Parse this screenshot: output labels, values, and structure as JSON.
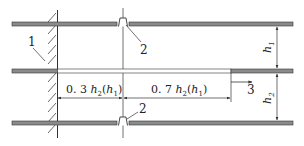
{
  "diagram": {
    "type": "technical-schematic",
    "colors": {
      "plate_fill": "#8a8a8a",
      "plate_stroke": "#333333",
      "line": "#333333",
      "background": "#ffffff"
    },
    "labels": {
      "wall": "1",
      "nozzle_top": "2",
      "nozzle_bottom": "2",
      "flow_direction": "3",
      "dim_left_prefix": "0. 3",
      "dim_left_var": "h",
      "dim_left_sub": "2",
      "dim_left_paren_var": "h",
      "dim_left_paren_sub": "1",
      "dim_right_prefix": "0. 7",
      "dim_right_var": "h",
      "dim_right_sub": "2",
      "dim_right_paren_var": "h",
      "dim_right_paren_sub": "1",
      "height_upper_var": "h",
      "height_upper_sub": "1",
      "height_lower_var": "h",
      "height_lower_sub": "2"
    },
    "components": [
      {
        "id": "1",
        "name": "wall"
      },
      {
        "id": "2",
        "name": "nozzle"
      },
      {
        "id": "3",
        "name": "flow-arrow"
      }
    ]
  }
}
